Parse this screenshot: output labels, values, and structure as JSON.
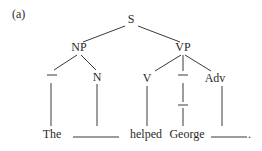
{
  "figure_label": "(a)",
  "tree": {
    "root": "S",
    "np": {
      "label": "NP",
      "children": [
        "—",
        "N"
      ]
    },
    "vp": {
      "label": "VP",
      "children": [
        "V",
        "—",
        "Adv"
      ]
    }
  },
  "sentence": {
    "words": [
      "The",
      "",
      "helped",
      "George",
      ""
    ],
    "final_punct": "."
  }
}
